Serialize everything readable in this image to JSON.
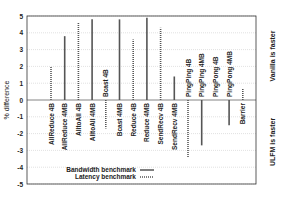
{
  "chart_data": {
    "type": "bar",
    "title": "",
    "xlabel": "",
    "ylabel": "% difference",
    "ylim": [
      -5,
      5
    ],
    "yticks": [
      5,
      4,
      3,
      2,
      1,
      0,
      -1,
      -2,
      -3,
      -4,
      -5
    ],
    "grid": true,
    "right_annotations": {
      "top": "Vanilla is faster",
      "bottom": "ULFM is faster"
    },
    "legend": {
      "position": "lower-left",
      "entries": [
        {
          "label": "Bandwidth benchmark",
          "style": "solid"
        },
        {
          "label": "Latency benchmark",
          "style": "dotted"
        }
      ]
    },
    "categories": [
      "AllReduce 4B",
      "AllReduce 4MB",
      "AlltoAll 4B",
      "AlltoAll 4MB",
      "Bcast 4B",
      "Bcast 4MB",
      "Reduce 4B",
      "Reduce 4MB",
      "SendRecv 4B",
      "SendRecv 4MB",
      "PingPing 4B",
      "PingPing 4MB",
      "PingPong 4B",
      "PingPong 4MB",
      "Barrier"
    ],
    "series_type": [
      "latency",
      "bandwidth",
      "latency",
      "bandwidth",
      "latency",
      "bandwidth",
      "latency",
      "bandwidth",
      "latency",
      "bandwidth",
      "latency",
      "bandwidth",
      "latency",
      "bandwidth",
      "latency"
    ],
    "values": [
      2.0,
      3.8,
      4.6,
      4.8,
      -1.7,
      4.8,
      3.6,
      4.9,
      4.3,
      1.4,
      -3.4,
      -2.7,
      0.0,
      -1.5,
      0.7
    ],
    "series": [
      {
        "name": "Bandwidth benchmark",
        "values": [
          null,
          3.8,
          null,
          4.8,
          null,
          4.8,
          null,
          4.9,
          null,
          1.4,
          null,
          -2.7,
          null,
          -1.5,
          null
        ]
      },
      {
        "name": "Latency benchmark",
        "values": [
          2.0,
          null,
          4.6,
          null,
          -1.7,
          null,
          3.6,
          null,
          4.3,
          null,
          -3.4,
          null,
          0.0,
          null,
          0.7
        ]
      }
    ]
  },
  "axis": {
    "ylabel": "% difference",
    "right_top": "Vanilla is faster",
    "right_bottom": "ULFM is faster"
  },
  "legend": {
    "bandwidth": "Bandwidth benchmark",
    "latency": "Latency benchmark"
  }
}
